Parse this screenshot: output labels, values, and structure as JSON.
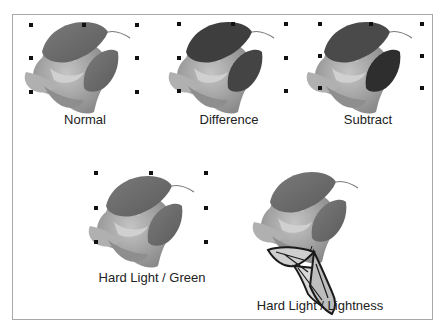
{
  "figure": {
    "samples": [
      {
        "label": "Normal",
        "mode": "normal"
      },
      {
        "label": "Difference",
        "mode": "difference"
      },
      {
        "label": "Subtract",
        "mode": "subtract"
      },
      {
        "label": "Hard Light / Green",
        "mode": "hardlight-green"
      },
      {
        "label": "Hard Light / Lightness",
        "mode": "hardlight-lightness"
      }
    ]
  },
  "colors": {
    "frame_border": "#a8a8a8",
    "handle": "#111111",
    "rose": "#9a9a9a",
    "leaf": "#6e6e6e",
    "leaf_dark": "#3c3c3c",
    "caption": "#222222"
  }
}
